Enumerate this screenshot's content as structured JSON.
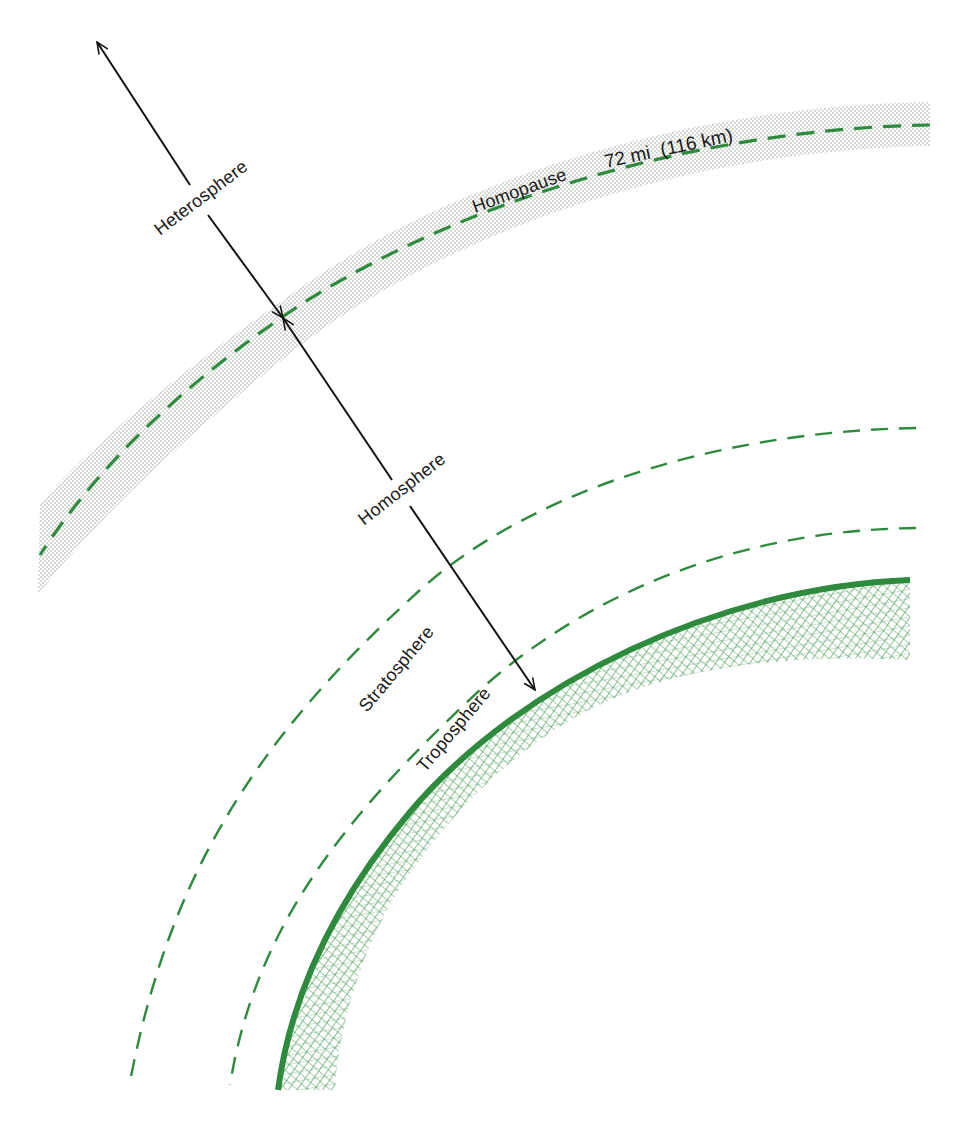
{
  "diagram": {
    "type": "atmosphere-layers-cross-section",
    "colors": {
      "green": "#2e8b3e",
      "green_dark": "#237a32",
      "band_dots": "#9aa89a",
      "arrow": "#111111",
      "text": "#1a1a1a"
    },
    "labels": {
      "heterosphere": "Heterosphere",
      "homopause": "Homopause",
      "homopause_altitude": "72 mi  (116 km)",
      "homosphere": "Homosphere",
      "stratosphere": "Stratosphere",
      "troposphere": "Troposphere"
    },
    "layers": [
      {
        "name": "Heterosphere",
        "boundary": "above Homopause"
      },
      {
        "name": "Homopause",
        "altitude_mi": 72,
        "altitude_km": 116,
        "style": "dashed line in stippled band"
      },
      {
        "name": "Homosphere",
        "boundary": "Homopause to Earth surface"
      },
      {
        "name": "Stratosphere",
        "style": "between outer and inner dashed arcs"
      },
      {
        "name": "Troposphere",
        "style": "between inner dashed arc and Earth surface"
      },
      {
        "name": "Earth surface",
        "style": "solid green arc with cross-hatched fill"
      }
    ]
  }
}
